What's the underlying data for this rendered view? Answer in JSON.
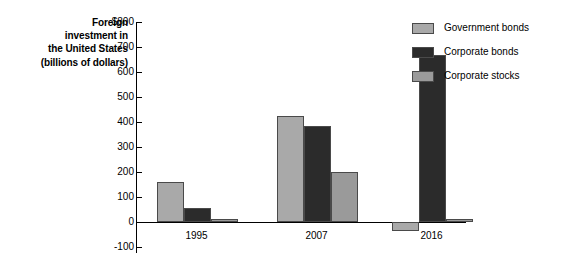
{
  "chart_data": {
    "type": "bar",
    "title": "",
    "ylabel": "Foreign investment in the United States (billions of dollars)",
    "ylabel_lines": [
      "Foreign",
      "investment in",
      "the United States",
      "(billions of dollars)"
    ],
    "xlabel": "",
    "categories": [
      "1995",
      "2007",
      "2016"
    ],
    "ylim": [
      -100,
      800
    ],
    "ytick_labels": [
      "$800",
      "700",
      "600",
      "500",
      "400",
      "300",
      "200",
      "100",
      "0",
      "-100"
    ],
    "ytick_values": [
      800,
      700,
      600,
      500,
      400,
      300,
      200,
      100,
      0,
      -100
    ],
    "grid": false,
    "legend_position": "right",
    "series": [
      {
        "name": "Government bonds",
        "color": "#a9a9a9",
        "values": [
          162,
          425,
          -35
        ]
      },
      {
        "name": "Corporate bonds",
        "color": "#2b2b2b",
        "values": [
          58,
          385,
          670
        ]
      },
      {
        "name": "Corporate stocks",
        "color": "#9a9a9a",
        "values": [
          11,
          200,
          12
        ]
      }
    ]
  },
  "legend": {
    "items": [
      {
        "label": "Government bonds",
        "color": "#a9a9a9"
      },
      {
        "label": "Corporate bonds",
        "color": "#2b2b2b"
      },
      {
        "label": "Corporate stocks",
        "color": "#9a9a9a"
      }
    ]
  }
}
